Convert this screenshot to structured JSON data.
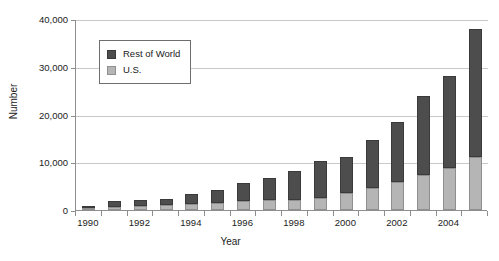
{
  "chart_data": {
    "type": "bar",
    "stacked": true,
    "title": "",
    "xlabel": "Year",
    "ylabel": "Number",
    "ylim": [
      0,
      40000
    ],
    "yticks": [
      0,
      10000,
      20000,
      30000,
      40000
    ],
    "ytick_labels": [
      "0",
      "10,000",
      "20,000",
      "30,000",
      "40,000"
    ],
    "grid": "horizontal",
    "legend_position": "upper-left-inside",
    "categories": [
      1990,
      1991,
      1992,
      1993,
      1994,
      1995,
      1996,
      1997,
      1998,
      1999,
      2000,
      2001,
      2002,
      2003,
      2004,
      2005
    ],
    "xtick_labels": [
      "1990",
      "",
      "1992",
      "",
      "1994",
      "",
      "1996",
      "",
      "1998",
      "",
      "2000",
      "",
      "2002",
      "",
      "2004",
      ""
    ],
    "series": [
      {
        "name": "U.S.",
        "color": "#b5b5b5",
        "values": [
          200,
          700,
          900,
          1000,
          1200,
          1500,
          1800,
          2000,
          2200,
          2600,
          3500,
          4700,
          5800,
          7400,
          8800,
          11000
        ]
      },
      {
        "name": "Rest of World",
        "color": "#4d4d4d",
        "values": [
          400,
          1100,
          1100,
          1400,
          2200,
          2700,
          3900,
          4800,
          5900,
          7700,
          7700,
          10000,
          12600,
          16400,
          19200,
          27000
        ]
      }
    ],
    "totals": [
      600,
      1800,
      2000,
      2400,
      3400,
      4200,
      5700,
      6800,
      8100,
      10300,
      11200,
      14700,
      18400,
      23800,
      28000,
      38000
    ]
  },
  "legend": {
    "items": [
      {
        "label": "Rest of World",
        "color": "#4d4d4d"
      },
      {
        "label": "U.S.",
        "color": "#b5b5b5"
      }
    ]
  },
  "axes": {
    "x_title": "Year",
    "y_title": "Number"
  },
  "colors": {
    "rest_of_world": "#4d4d4d",
    "us": "#b5b5b5",
    "axis": "#8e8e8e",
    "grid": "#c9c9c9",
    "background": "#ffffff"
  }
}
